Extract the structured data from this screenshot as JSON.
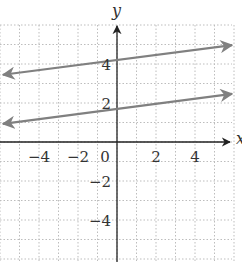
{
  "chart_data": {
    "type": "line",
    "title": "",
    "xlabel": "x",
    "ylabel": "y",
    "xlim": [
      -6,
      6
    ],
    "ylim": [
      -6,
      6
    ],
    "grid": true,
    "x_ticks": [
      -4,
      -2,
      0,
      2,
      4
    ],
    "y_ticks": [
      4,
      2,
      -2,
      -4
    ],
    "x_tick_labels": [
      "−4",
      "−2",
      "0",
      "2",
      "4"
    ],
    "y_tick_labels": [
      "4",
      "2",
      "−2",
      "−4"
    ],
    "series": [
      {
        "name": "upper line",
        "slope": 0.13,
        "intercept": 4.2,
        "x": [
          -5.85,
          5.9
        ],
        "y": [
          3.45,
          4.97
        ],
        "arrows": "both",
        "color": "#808080"
      },
      {
        "name": "lower line",
        "slope": 0.13,
        "intercept": 1.7,
        "x": [
          -5.85,
          5.9
        ],
        "y": [
          0.93,
          2.47
        ],
        "arrows": "both",
        "color": "#808080"
      }
    ]
  },
  "colors": {
    "axis": "#222222",
    "grid": "#bdbdbd",
    "line": "#808080"
  }
}
